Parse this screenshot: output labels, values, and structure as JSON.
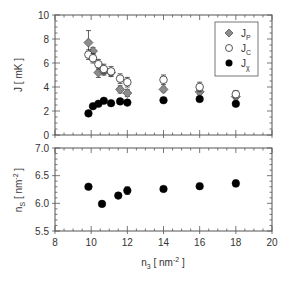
{
  "chart_data": [
    {
      "type": "scatter",
      "panel": "top",
      "xlabel": "n3 [ nm^-2 ]",
      "ylabel": "J [ mK ]",
      "ylabel_parts": {
        "main": "J",
        "unit": "[ mK ]"
      },
      "xlim": [
        8,
        20
      ],
      "ylim": [
        0,
        10
      ],
      "x_ticks": [
        8,
        10,
        12,
        14,
        16,
        18,
        20
      ],
      "y_ticks": [
        0,
        2,
        4,
        6,
        8,
        10
      ],
      "y_tick_labels": [
        "0",
        "2",
        "4",
        "6",
        "8",
        "10"
      ],
      "grid": false,
      "legend_position": "upper right",
      "series": [
        {
          "name": "J_P",
          "label_main": "J",
          "label_sub": "P",
          "marker": "diamond",
          "color": "#8c8c8c",
          "x": [
            9.85,
            10.1,
            10.4,
            10.7,
            11.1,
            11.6,
            12.0,
            14.0,
            16.0,
            18.0
          ],
          "y": [
            7.7,
            7.0,
            5.2,
            5.3,
            5.2,
            3.8,
            3.5,
            3.8,
            3.6,
            3.2
          ],
          "err": [
            1.0,
            0.3,
            0.4,
            0.3,
            0.3,
            0.3,
            0.3,
            0.2,
            0.2,
            0.2
          ]
        },
        {
          "name": "J_C",
          "label_main": "J",
          "label_sub": "C",
          "marker": "open-circle",
          "color": "#ffffff",
          "x": [
            9.85,
            10.1,
            10.4,
            10.7,
            11.1,
            11.6,
            12.0,
            14.0,
            16.0,
            18.0
          ],
          "y": [
            6.7,
            6.4,
            5.9,
            5.5,
            5.3,
            4.7,
            4.4,
            4.6,
            4.0,
            3.4
          ],
          "err": [
            0.4,
            0.4,
            0.4,
            0.4,
            0.4,
            0.4,
            0.4,
            0.4,
            0.4,
            0.3
          ]
        },
        {
          "name": "J_X",
          "label_main": "J",
          "label_sub": "χ",
          "marker": "filled-circle",
          "color": "#000000",
          "x": [
            9.85,
            10.1,
            10.4,
            10.7,
            11.1,
            11.6,
            12.0,
            14.0,
            16.0,
            18.0
          ],
          "y": [
            1.8,
            2.4,
            2.6,
            2.85,
            2.65,
            2.8,
            2.7,
            2.9,
            3.0,
            2.6
          ],
          "err": [
            0,
            0,
            0,
            0,
            0,
            0,
            0,
            0,
            0,
            0
          ]
        }
      ]
    },
    {
      "type": "scatter",
      "panel": "bottom",
      "xlabel": "n3 [ nm^-2 ]",
      "xlabel_parts": {
        "main": "n",
        "sub": "3",
        "unit_pre": "[ nm",
        "unit_sup": "-2",
        "unit_post": " ]"
      },
      "ylabel": "nS [ nm^-2 ]",
      "ylabel_parts": {
        "main": "n",
        "sub": "S",
        "unit_pre": "[ nm",
        "unit_sup": "-2",
        "unit_post": " ]"
      },
      "xlim": [
        8,
        20
      ],
      "ylim": [
        5.5,
        7.0
      ],
      "x_ticks": [
        8,
        10,
        12,
        14,
        16,
        18,
        20
      ],
      "x_tick_labels": [
        "8",
        "10",
        "12",
        "14",
        "16",
        "18",
        "20"
      ],
      "y_ticks": [
        5.5,
        6.0,
        6.5,
        7.0
      ],
      "y_tick_labels": [
        "5.5",
        "6.0",
        "6.5",
        "7.0"
      ],
      "grid": false,
      "series": [
        {
          "name": "n_S",
          "marker": "filled-circle",
          "color": "#000000",
          "x": [
            9.85,
            10.6,
            11.5,
            12.0,
            14.0,
            16.0,
            18.0
          ],
          "y": [
            6.3,
            5.99,
            6.14,
            6.23,
            6.26,
            6.31,
            6.36
          ],
          "err": [
            0.03,
            0.02,
            0.04,
            0.07,
            0.03,
            0.05,
            0.06
          ]
        }
      ]
    }
  ]
}
